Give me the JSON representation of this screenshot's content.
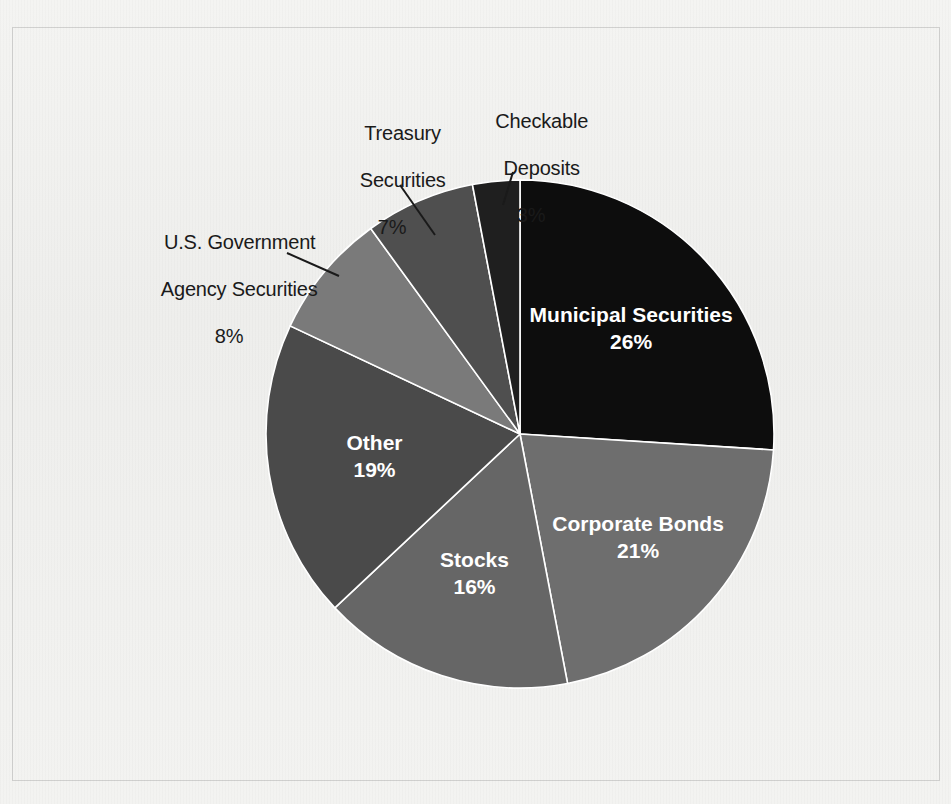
{
  "chart_data": {
    "type": "pie",
    "title": "",
    "subtitle": "",
    "xlabel": "",
    "ylabel": "",
    "legend_position": "none",
    "grid": false,
    "units": "percent",
    "total": 100,
    "start_angle_deg": 0,
    "direction": "clockwise",
    "categories": [
      "Municipal Securities",
      "Corporate Bonds",
      "Stocks",
      "Other",
      "U.S. Government Agency Securities",
      "Treasury Securities",
      "Checkable Deposits"
    ],
    "values": [
      26,
      21,
      16,
      19,
      8,
      7,
      3
    ],
    "slices": [
      {
        "label": "Municipal Securities",
        "label_line1": "Municipal Securities",
        "value": 26,
        "pct_text": "26%",
        "color": "#0d0d0d",
        "label_placement": "inside"
      },
      {
        "label": "Corporate Bonds",
        "label_line1": "Corporate Bonds",
        "value": 21,
        "pct_text": "21%",
        "color": "#6e6e6e",
        "label_placement": "inside"
      },
      {
        "label": "Stocks",
        "label_line1": "Stocks",
        "value": 16,
        "pct_text": "16%",
        "color": "#666666",
        "label_placement": "inside"
      },
      {
        "label": "Other",
        "label_line1": "Other",
        "value": 19,
        "pct_text": "19%",
        "color": "#4a4a4a",
        "label_placement": "inside"
      },
      {
        "label": "U.S. Government Agency Securities",
        "label_line1": "U.S. Government",
        "label_line2": "Agency Securities",
        "value": 8,
        "pct_text": "8%",
        "color": "#7a7a7a",
        "label_placement": "outside"
      },
      {
        "label": "Treasury Securities",
        "label_line1": "Treasury",
        "label_line2": "Securities",
        "value": 7,
        "pct_text": "7%",
        "color": "#4f4f4f",
        "label_placement": "outside"
      },
      {
        "label": "Checkable Deposits",
        "label_line1": "Checkable",
        "label_line2": "Deposits",
        "value": 3,
        "pct_text": "3%",
        "color": "#1f1f1f",
        "label_placement": "outside"
      }
    ],
    "colors": {
      "background": "#f2f2f0",
      "frame_border": "#8a8a8a",
      "slice_separator": "#ffffff",
      "inside_label_text": "#ffffff",
      "outside_label_text": "#1a1a1a",
      "leader_line": "#1a1a1a"
    }
  }
}
